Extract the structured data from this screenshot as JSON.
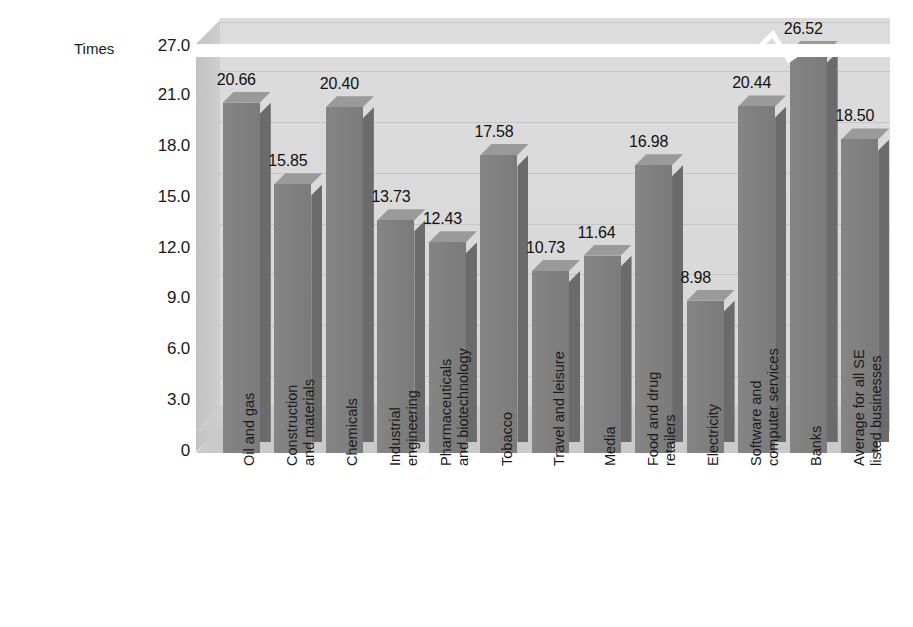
{
  "chart_data": {
    "type": "bar",
    "title": "",
    "subtitle": "",
    "xlabel": "",
    "ylabel": "Times",
    "ylim": [
      0,
      27
    ],
    "y_ticks": [
      "27.0",
      "21.0",
      "18.0",
      "15.0",
      "12.0",
      "9.0",
      "6.0",
      "3.0",
      "0"
    ],
    "y_tick_values": [
      27.0,
      21.0,
      18.0,
      15.0,
      12.0,
      9.0,
      6.0,
      3.0,
      0
    ],
    "axis_break": {
      "present": true,
      "between": [
        21.0,
        27.0
      ],
      "style": "zigzag"
    },
    "grid": true,
    "legend": "none",
    "style3d": true,
    "categories": [
      "Oil and gas",
      "Construction and materials",
      "Chemicals",
      "Industrial engineering",
      "Pharmaceuticals and biotechnology",
      "Tobacco",
      "Travel and leisure",
      "Media",
      "Food and drug retailers",
      "Electricity",
      "Software and computer services",
      "Banks",
      "Average for all SE listed businesses"
    ],
    "category_lines": [
      [
        "Oil and gas"
      ],
      [
        "Construction",
        "and materials"
      ],
      [
        "Chemicals"
      ],
      [
        "Industrial",
        "engineering"
      ],
      [
        "Pharmaceuticals",
        "and biotechnology"
      ],
      [
        "Tobacco"
      ],
      [
        "Travel and leisure"
      ],
      [
        "Media"
      ],
      [
        "Food and drug",
        "retailers"
      ],
      [
        "Electricity"
      ],
      [
        "Software and",
        "computer services"
      ],
      [
        "Banks"
      ],
      [
        "Average for all SE",
        "listed businesses"
      ]
    ],
    "values": [
      20.66,
      15.85,
      20.4,
      13.73,
      12.43,
      17.58,
      10.73,
      11.64,
      16.98,
      8.98,
      20.44,
      26.52,
      18.5
    ],
    "value_labels": [
      "20.66",
      "15.85",
      "20.40",
      "13.73",
      "12.43",
      "17.58",
      "10.73",
      "11.64",
      "16.98",
      "8.98",
      "20.44",
      "26.52",
      "18.50"
    ],
    "colors": {
      "bar_front": "#7f7f7f",
      "bar_side": "#6b6b6b",
      "bar_top": "#9a9a9a",
      "plot_background": "#dadada",
      "floor": "#cacaca",
      "gridline": "#c6c6c6",
      "page_background": "#ffffff",
      "text": "#1a1a1a",
      "break_band": "#ffffff"
    }
  }
}
